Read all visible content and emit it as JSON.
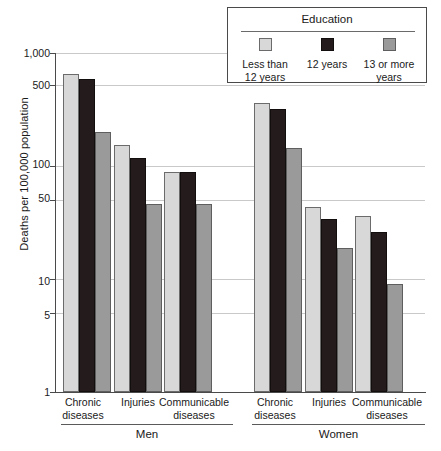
{
  "chart_data": {
    "type": "bar",
    "title": "",
    "xlabel": "",
    "ylabel": "Deaths per 100,000 population",
    "yscale": "log",
    "ylim": [
      1,
      1000
    ],
    "ytick_labels": [
      "1,000",
      "500",
      "100",
      "50",
      "10",
      "5",
      "1"
    ],
    "ytick_values": [
      1000,
      500,
      100,
      50,
      10,
      5,
      1
    ],
    "grid": "horizontal",
    "legend_position": "top-right",
    "legend_title": "Education",
    "categories": [
      "Chronic diseases",
      "Injuries",
      "Communicable diseases",
      "Chronic diseases",
      "Injuries",
      "Communicable diseases"
    ],
    "supergroups": [
      {
        "label": "Men",
        "categories": [
          "Chronic diseases",
          "Injuries",
          "Communicable diseases"
        ]
      },
      {
        "label": "Women",
        "categories": [
          "Chronic diseases",
          "Injuries",
          "Communicable diseases"
        ]
      }
    ],
    "series": [
      {
        "name": "Less than 12 years",
        "color": "#d8d8d8",
        "values": [
          650,
          155,
          88,
          360,
          43,
          36
        ]
      },
      {
        "name": "12 years",
        "color": "#241c1c",
        "values": [
          590,
          118,
          88,
          320,
          34,
          26
        ]
      },
      {
        "name": "13 or more years",
        "color": "#9a9a9a",
        "values": [
          200,
          46,
          46,
          145,
          19,
          9
        ]
      }
    ]
  },
  "axes": {
    "y_title": "Deaths per 100,000 population",
    "y_ticks": [
      {
        "label": "1,000",
        "value": 1000
      },
      {
        "label": "500",
        "value": 500
      },
      {
        "label": "100",
        "value": 100
      },
      {
        "label": "50",
        "value": 50
      },
      {
        "label": "10",
        "value": 10
      },
      {
        "label": "5",
        "value": 5
      },
      {
        "label": "1",
        "value": 1
      }
    ],
    "x_categories": [
      {
        "line1": "Chronic",
        "line2": "diseases"
      },
      {
        "line1": "Injuries",
        "line2": ""
      },
      {
        "line1": "Communicable",
        "line2": "diseases"
      },
      {
        "line1": "Chronic",
        "line2": "diseases"
      },
      {
        "line1": "Injuries",
        "line2": ""
      },
      {
        "line1": "Communicable",
        "line2": "diseases"
      }
    ],
    "x_groups": [
      {
        "label": "Men"
      },
      {
        "label": "Women"
      }
    ]
  },
  "legend": {
    "title": "Education",
    "items": [
      {
        "label_line1": "Less than",
        "label_line2": "12 years",
        "color": "#d8d8d8"
      },
      {
        "label_line1": "12 years",
        "label_line2": "",
        "color": "#241c1c"
      },
      {
        "label_line1": "13 or more",
        "label_line2": "years",
        "color": "#9a9a9a"
      }
    ]
  }
}
